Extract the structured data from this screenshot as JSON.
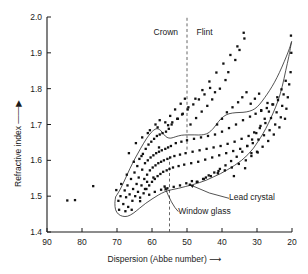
{
  "chart_data": {
    "type": "scatter",
    "title": "",
    "xlabel": "Dispersion (Abbe number)",
    "ylabel": "Refractive index",
    "xlim": [
      90,
      20
    ],
    "ylim": [
      1.4,
      2.0
    ],
    "x_axis_reversed": true,
    "grid": false,
    "legend": "none",
    "xticks": [
      90,
      80,
      70,
      60,
      50,
      40,
      30,
      20
    ],
    "yticks": [
      "1.4",
      "1.5",
      "1.6",
      "1.7",
      "1.8",
      "1.9",
      "2.0"
    ],
    "xtick_labels": [
      "90",
      "80",
      "70",
      "60",
      "50",
      "40",
      "30",
      "20"
    ],
    "ytick_labels": [
      "1.4",
      "1.5",
      "1.6",
      "1.7",
      "1.8",
      "1.9",
      "2.0"
    ],
    "region_labels": [
      {
        "text": "Crown",
        "x": 56,
        "y": 1.955
      },
      {
        "text": "Flint",
        "x": 45,
        "y": 1.955
      }
    ],
    "dividers": [
      {
        "name": "crown-flint-divider",
        "x": 50,
        "y_from": 1.63,
        "y_to": 2.0,
        "style": "dashed"
      },
      {
        "name": "window-glass-divider",
        "x": 55,
        "y_from": 1.4,
        "y_to": 1.61,
        "style": "dashed"
      }
    ],
    "callouts": [
      {
        "text": "Lead crystal",
        "label_x": 38.0,
        "label_y": 1.494,
        "point_x": 49.2,
        "point_y": 1.532
      },
      {
        "text": "Window glass",
        "label_x": 52.5,
        "label_y": 1.457,
        "point_x": 56.4,
        "point_y": 1.527
      }
    ],
    "envelope_note": "outline enclosing the optical-glass population",
    "envelope_upper": [
      [
        70.4,
        1.498
      ],
      [
        69.2,
        1.517
      ],
      [
        67.8,
        1.545
      ],
      [
        66.3,
        1.577
      ],
      [
        64.8,
        1.606
      ],
      [
        63.2,
        1.634
      ],
      [
        61.6,
        1.66
      ],
      [
        60.2,
        1.678
      ],
      [
        58.8,
        1.688
      ],
      [
        57.6,
        1.684
      ],
      [
        56.6,
        1.672
      ],
      [
        55.7,
        1.664
      ],
      [
        54.6,
        1.662
      ],
      [
        53.2,
        1.666
      ],
      [
        51.6,
        1.67
      ],
      [
        49.8,
        1.671
      ],
      [
        47.8,
        1.671
      ],
      [
        45.8,
        1.671
      ],
      [
        44.0,
        1.676
      ],
      [
        42.4,
        1.69
      ],
      [
        41.0,
        1.708
      ],
      [
        39.6,
        1.722
      ],
      [
        38.0,
        1.73
      ],
      [
        36.0,
        1.733
      ],
      [
        34.0,
        1.734
      ],
      [
        32.2,
        1.737
      ],
      [
        30.6,
        1.744
      ],
      [
        29.2,
        1.757
      ],
      [
        27.8,
        1.775
      ],
      [
        26.4,
        1.795
      ],
      [
        25.0,
        1.818
      ],
      [
        23.6,
        1.845
      ],
      [
        22.2,
        1.876
      ],
      [
        21.0,
        1.905
      ],
      [
        20.2,
        1.928
      ]
    ],
    "envelope_lower": [
      [
        70.4,
        1.498
      ],
      [
        70.6,
        1.48
      ],
      [
        70.4,
        1.462
      ],
      [
        69.6,
        1.45
      ],
      [
        68.4,
        1.444
      ],
      [
        67.0,
        1.444
      ],
      [
        65.4,
        1.452
      ],
      [
        63.6,
        1.466
      ],
      [
        61.8,
        1.48
      ],
      [
        60.0,
        1.492
      ],
      [
        58.2,
        1.503
      ],
      [
        56.4,
        1.512
      ],
      [
        54.4,
        1.518
      ],
      [
        52.4,
        1.522
      ],
      [
        50.4,
        1.527
      ],
      [
        48.4,
        1.532
      ],
      [
        46.4,
        1.538
      ],
      [
        44.4,
        1.545
      ],
      [
        42.4,
        1.554
      ],
      [
        40.4,
        1.563
      ],
      [
        38.4,
        1.574
      ],
      [
        36.4,
        1.586
      ],
      [
        34.4,
        1.6
      ],
      [
        32.6,
        1.616
      ],
      [
        31.0,
        1.634
      ],
      [
        29.6,
        1.654
      ],
      [
        28.2,
        1.676
      ],
      [
        26.8,
        1.702
      ],
      [
        25.4,
        1.732
      ],
      [
        24.0,
        1.766
      ],
      [
        22.8,
        1.806
      ],
      [
        21.8,
        1.85
      ],
      [
        20.9,
        1.89
      ],
      [
        20.2,
        1.928
      ]
    ],
    "points": [
      [
        84.2,
        1.488
      ],
      [
        82.0,
        1.489
      ],
      [
        76.8,
        1.528
      ],
      [
        70.2,
        1.517
      ],
      [
        69.6,
        1.487
      ],
      [
        69.0,
        1.5
      ],
      [
        68.8,
        1.534
      ],
      [
        68.2,
        1.478
      ],
      [
        67.8,
        1.516
      ],
      [
        67.4,
        1.497
      ],
      [
        67.0,
        1.53
      ],
      [
        66.8,
        1.47
      ],
      [
        66.4,
        1.505
      ],
      [
        66.0,
        1.548
      ],
      [
        65.6,
        1.487
      ],
      [
        65.4,
        1.52
      ],
      [
        65.0,
        1.566
      ],
      [
        64.8,
        1.5
      ],
      [
        64.4,
        1.534
      ],
      [
        64.2,
        1.584
      ],
      [
        64.0,
        1.512
      ],
      [
        63.8,
        1.552
      ],
      [
        63.6,
        1.604
      ],
      [
        63.4,
        1.496
      ],
      [
        63.0,
        1.53
      ],
      [
        62.8,
        1.574
      ],
      [
        62.6,
        1.618
      ],
      [
        62.4,
        1.508
      ],
      [
        62.2,
        1.548
      ],
      [
        62.0,
        1.592
      ],
      [
        61.8,
        1.632
      ],
      [
        61.6,
        1.52
      ],
      [
        61.4,
        1.56
      ],
      [
        61.2,
        1.6
      ],
      [
        61.0,
        1.644
      ],
      [
        60.8,
        1.53
      ],
      [
        60.6,
        1.572
      ],
      [
        60.4,
        1.608
      ],
      [
        60.2,
        1.652
      ],
      [
        60.0,
        1.54
      ],
      [
        59.8,
        1.58
      ],
      [
        59.6,
        1.614
      ],
      [
        59.4,
        1.66
      ],
      [
        59.2,
        1.548
      ],
      [
        59.0,
        1.586
      ],
      [
        58.8,
        1.62
      ],
      [
        58.6,
        1.668
      ],
      [
        58.4,
        1.556
      ],
      [
        58.2,
        1.592
      ],
      [
        58.0,
        1.624
      ],
      [
        57.8,
        1.672
      ],
      [
        57.6,
        1.562
      ],
      [
        57.4,
        1.596
      ],
      [
        57.2,
        1.628
      ],
      [
        57.0,
        1.676
      ],
      [
        56.8,
        1.568
      ],
      [
        56.6,
        1.6
      ],
      [
        56.4,
        1.527
      ],
      [
        56.2,
        1.632
      ],
      [
        56.0,
        1.68
      ],
      [
        55.8,
        1.572
      ],
      [
        55.6,
        1.604
      ],
      [
        55.4,
        1.636
      ],
      [
        55.2,
        1.688
      ],
      [
        55.0,
        1.576
      ],
      [
        54.8,
        1.608
      ],
      [
        54.6,
        1.64
      ],
      [
        54.4,
        1.7
      ],
      [
        54.0,
        1.58
      ],
      [
        53.6,
        1.612
      ],
      [
        53.2,
        1.648
      ],
      [
        52.8,
        1.716
      ],
      [
        52.4,
        1.584
      ],
      [
        52.0,
        1.616
      ],
      [
        51.6,
        1.652
      ],
      [
        51.2,
        1.73
      ],
      [
        50.8,
        1.588
      ],
      [
        50.4,
        1.62
      ],
      [
        50.0,
        1.656
      ],
      [
        49.6,
        1.748
      ],
      [
        49.2,
        1.532
      ],
      [
        48.8,
        1.592
      ],
      [
        48.4,
        1.624
      ],
      [
        48.0,
        1.66
      ],
      [
        47.6,
        1.772
      ],
      [
        47.2,
        1.54
      ],
      [
        46.8,
        1.596
      ],
      [
        46.4,
        1.628
      ],
      [
        46.0,
        1.664
      ],
      [
        45.6,
        1.796
      ],
      [
        45.2,
        1.548
      ],
      [
        44.8,
        1.602
      ],
      [
        44.4,
        1.632
      ],
      [
        44.0,
        1.668
      ],
      [
        43.6,
        1.82
      ],
      [
        43.2,
        1.556
      ],
      [
        42.8,
        1.608
      ],
      [
        42.4,
        1.636
      ],
      [
        42.0,
        1.672
      ],
      [
        41.6,
        1.845
      ],
      [
        41.2,
        1.564
      ],
      [
        40.8,
        1.614
      ],
      [
        40.4,
        1.64
      ],
      [
        40.0,
        1.68
      ],
      [
        39.6,
        1.87
      ],
      [
        39.2,
        1.572
      ],
      [
        38.8,
        1.62
      ],
      [
        38.4,
        1.646
      ],
      [
        38.0,
        1.69
      ],
      [
        37.6,
        1.894
      ],
      [
        37.2,
        1.58
      ],
      [
        36.8,
        1.626
      ],
      [
        36.4,
        1.652
      ],
      [
        36.0,
        1.7
      ],
      [
        35.6,
        1.918
      ],
      [
        35.2,
        1.59
      ],
      [
        34.8,
        1.632
      ],
      [
        34.4,
        1.66
      ],
      [
        34.0,
        1.712
      ],
      [
        33.6,
        1.94
      ],
      [
        33.2,
        1.6
      ],
      [
        32.8,
        1.64
      ],
      [
        32.4,
        1.668
      ],
      [
        32.0,
        1.722
      ],
      [
        31.6,
        1.612
      ],
      [
        31.2,
        1.648
      ],
      [
        30.8,
        1.678
      ],
      [
        30.4,
        1.73
      ],
      [
        30.0,
        1.624
      ],
      [
        29.6,
        1.658
      ],
      [
        29.2,
        1.69
      ],
      [
        28.8,
        1.738
      ],
      [
        28.4,
        1.638
      ],
      [
        28.0,
        1.67
      ],
      [
        27.6,
        1.704
      ],
      [
        27.2,
        1.746
      ],
      [
        26.8,
        1.654
      ],
      [
        26.4,
        1.684
      ],
      [
        26.0,
        1.718
      ],
      [
        25.6,
        1.756
      ],
      [
        25.2,
        1.672
      ],
      [
        24.8,
        1.7
      ],
      [
        24.4,
        1.734
      ],
      [
        24.0,
        1.768
      ],
      [
        23.6,
        1.692
      ],
      [
        23.2,
        1.72
      ],
      [
        22.8,
        1.752
      ],
      [
        22.4,
        1.784
      ],
      [
        22.0,
        1.716
      ],
      [
        21.6,
        1.744
      ],
      [
        21.2,
        1.776
      ],
      [
        20.8,
        1.812
      ],
      [
        20.4,
        1.846
      ],
      [
        20.2,
        1.9
      ],
      [
        20.3,
        1.948
      ],
      [
        59.0,
        1.7
      ],
      [
        57.8,
        1.712
      ],
      [
        56.2,
        1.706
      ],
      [
        54.8,
        1.724
      ],
      [
        53.4,
        1.742
      ],
      [
        51.8,
        1.758
      ],
      [
        50.6,
        1.772
      ],
      [
        49.0,
        1.7
      ],
      [
        47.4,
        1.718
      ],
      [
        45.8,
        1.736
      ],
      [
        44.2,
        1.752
      ],
      [
        42.8,
        1.77
      ],
      [
        41.4,
        1.7
      ],
      [
        40.0,
        1.716
      ],
      [
        38.6,
        1.734
      ],
      [
        37.0,
        1.748
      ],
      [
        35.4,
        1.762
      ],
      [
        34.2,
        1.776
      ],
      [
        33.0,
        1.79
      ],
      [
        31.8,
        1.758
      ],
      [
        30.6,
        1.772
      ],
      [
        29.4,
        1.786
      ],
      [
        33.8,
        1.956
      ],
      [
        35.0,
        1.908
      ],
      [
        36.2,
        1.88
      ],
      [
        38.2,
        1.846
      ],
      [
        39.0,
        1.824
      ],
      [
        40.6,
        1.8
      ],
      [
        42.0,
        1.79
      ],
      [
        43.4,
        1.802
      ],
      [
        45.0,
        1.784
      ],
      [
        46.6,
        1.77
      ],
      [
        48.2,
        1.756
      ],
      [
        49.8,
        1.742
      ],
      [
        51.4,
        1.728
      ],
      [
        52.6,
        1.716
      ],
      [
        54.2,
        1.706
      ],
      [
        55.4,
        1.698
      ],
      [
        58.4,
        1.692
      ],
      [
        60.6,
        1.684
      ],
      [
        47.0,
        1.54
      ],
      [
        45.4,
        1.548
      ],
      [
        43.8,
        1.558
      ],
      [
        42.2,
        1.566
      ],
      [
        40.6,
        1.576
      ],
      [
        39.0,
        1.586
      ],
      [
        37.4,
        1.598
      ],
      [
        35.8,
        1.61
      ],
      [
        34.2,
        1.624
      ],
      [
        32.8,
        1.64
      ],
      [
        31.4,
        1.658
      ],
      [
        30.2,
        1.676
      ],
      [
        29.0,
        1.696
      ],
      [
        27.8,
        1.716
      ],
      [
        26.6,
        1.736
      ],
      [
        25.4,
        1.756
      ],
      [
        24.2,
        1.776
      ],
      [
        23.0,
        1.798
      ],
      [
        21.8,
        1.822
      ],
      [
        31.6,
        1.62
      ],
      [
        29.8,
        1.622
      ],
      [
        33.4,
        1.578
      ],
      [
        36.6,
        1.556
      ],
      [
        28.8,
        1.74
      ],
      [
        27.0,
        1.76
      ],
      [
        62.0,
        1.52
      ],
      [
        63.4,
        1.486
      ],
      [
        65.8,
        1.462
      ],
      [
        67.6,
        1.458
      ],
      [
        69.4,
        1.462
      ],
      [
        60.8,
        1.504
      ],
      [
        59.2,
        1.512
      ],
      [
        57.4,
        1.518
      ],
      [
        55.6,
        1.522
      ],
      [
        53.8,
        1.526
      ],
      [
        52.0,
        1.53
      ],
      [
        50.2,
        1.536
      ],
      [
        48.6,
        1.542
      ],
      [
        44.6,
        1.552
      ],
      [
        41.0,
        1.57
      ],
      [
        66.6,
        1.62
      ],
      [
        64.6,
        1.648
      ],
      [
        62.8,
        1.664
      ],
      [
        61.2,
        1.676
      ],
      [
        58.0,
        1.636
      ],
      [
        67.2,
        1.56
      ],
      [
        65.2,
        1.596
      ],
      [
        63.0,
        1.612
      ],
      [
        61.4,
        1.54
      ],
      [
        59.6,
        1.552
      ]
    ]
  },
  "axes": {
    "xlabel_arrow": "⟶",
    "ylabel_arrow": "↑"
  }
}
